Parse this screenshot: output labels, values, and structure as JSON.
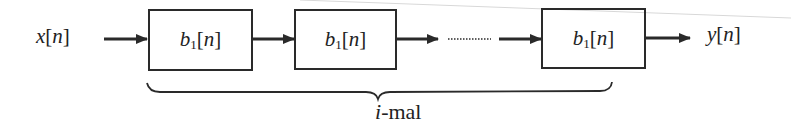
{
  "diagram": {
    "type": "block-diagram",
    "input": {
      "symbol": "x",
      "index": "n"
    },
    "output": {
      "symbol": "y",
      "index": "n"
    },
    "blocks": [
      {
        "symbol": "b",
        "subscript": "1",
        "index": "n"
      },
      {
        "symbol": "b",
        "subscript": "1",
        "index": "n"
      },
      {
        "symbol": "b",
        "subscript": "1",
        "index": "n"
      }
    ],
    "ellipsis": "dotted-continuation",
    "brace_label": {
      "var": "i",
      "suffix": "-mal"
    }
  },
  "colors": {
    "stroke": "#2a2a2a",
    "text": "#222222",
    "background": "#ffffff"
  }
}
